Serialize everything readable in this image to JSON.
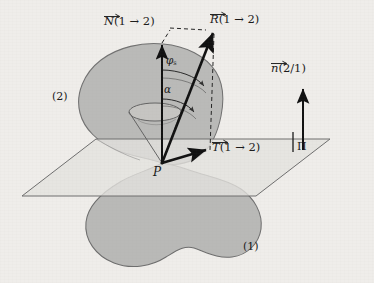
{
  "figure": {
    "background_color": "#efedea",
    "body_fill_color": "#b9b9b7",
    "body_stroke_color": "#6b6b6b",
    "plane_fill_color": "#e2e1dd",
    "plane_stroke_color": "#6b6b6b",
    "vector_color": "#111111",
    "dashed_color": "#222222",
    "cone_stroke_color": "#5f5f5f"
  },
  "labels": {
    "normal_force": {
      "symbol": "N",
      "args": "(1 → 2)",
      "full": "N⃗(1 → 2)",
      "name": "normal-force-vector-label"
    },
    "resultant_force": {
      "symbol": "R",
      "args": "(1 → 2)",
      "full": "R⃗(1 → 2)",
      "name": "resultant-force-vector-label"
    },
    "tangential_force": {
      "symbol": "T",
      "args": "(1 → 2)",
      "full": "T⃗(1 → 2)",
      "name": "tangential-force-vector-label"
    },
    "unit_normal": {
      "symbol": "n",
      "args": "(2/1)",
      "full": "n⃗(2/1)",
      "name": "unit-normal-vector-label"
    },
    "tangent_plane": {
      "symbol": "Π",
      "name": "tangent-plane-label"
    },
    "contact_point": {
      "symbol": "P",
      "name": "contact-point-label"
    },
    "friction_angle": {
      "symbol": "φ",
      "subscript": "s",
      "full": "φs",
      "name": "friction-cone-angle-label"
    },
    "force_angle": {
      "symbol": "α",
      "full": "α",
      "name": "force-inclination-angle-label"
    },
    "body_upper": {
      "text": "(2)",
      "name": "upper-body-label"
    },
    "body_lower": {
      "text": "(1)",
      "name": "lower-body-label"
    }
  },
  "geometry": {
    "contact_point_px": {
      "x": 162,
      "y": 163
    },
    "normal_arrow_tip_px": {
      "x": 162,
      "y": 43
    },
    "resultant_arrow_tip_px": {
      "x": 214,
      "y": 30
    },
    "tangential_arrow_tip_px": {
      "x": 208,
      "y": 150
    },
    "unit_normal_arrow": {
      "x": 303,
      "base_y": 150,
      "tip_y": 87
    },
    "plane_corners_px": [
      {
        "x": 96,
        "y": 139
      },
      {
        "x": 330,
        "y": 139
      },
      {
        "x": 256,
        "y": 196
      },
      {
        "x": 22,
        "y": 196
      }
    ],
    "cone_apex_px": {
      "x": 162,
      "y": 163
    },
    "cone_rim_center_px": {
      "x": 155,
      "y": 112
    },
    "cone_rim_radii_px": {
      "rx": 26,
      "ry": 9
    }
  }
}
